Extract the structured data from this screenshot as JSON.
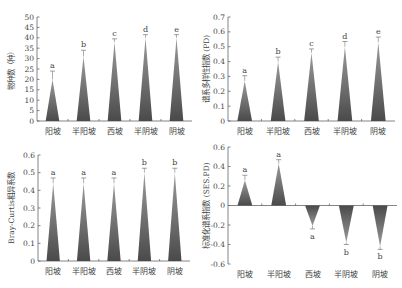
{
  "colors": {
    "bar_top": "#9a9a9a",
    "bar_bottom": "#4a4a4a",
    "axis": "#666666",
    "text": "#444444"
  },
  "chart_data": [
    {
      "id": "species",
      "type": "bar",
      "bar_shape": "triangle",
      "title": "",
      "xlabel": "",
      "ylabel": "物种数（种）",
      "categories": [
        "阳坡",
        "半阳坡",
        "西坡",
        "半阴坡",
        "阴坡"
      ],
      "values": [
        20,
        31,
        38,
        40,
        40
      ],
      "error_upper": [
        24,
        34,
        39.5,
        41.5,
        41.5
      ],
      "significance": [
        "a",
        "b",
        "c",
        "d",
        "e"
      ],
      "ylim": [
        0,
        50
      ],
      "yticks": [
        0,
        5,
        10,
        15,
        20,
        25,
        30,
        35,
        40,
        45,
        50
      ],
      "ytick_labels": [
        "0",
        "5",
        "10",
        "15",
        "20",
        "25",
        "30",
        "35",
        "40",
        "45",
        "50"
      ],
      "grid": false,
      "legend": "none"
    },
    {
      "id": "pd",
      "type": "bar",
      "bar_shape": "triangle",
      "title": "",
      "xlabel": "",
      "ylabel": "谱系多样性指数 (PD)",
      "categories": [
        "阳坡",
        "半阳坡",
        "西坡",
        "半阴坡",
        "阴坡"
      ],
      "values": [
        0.27,
        0.4,
        0.46,
        0.5,
        0.53
      ],
      "error_upper": [
        0.305,
        0.43,
        0.485,
        0.535,
        0.565
      ],
      "significance": [
        "a",
        "b",
        "c",
        "d",
        "e"
      ],
      "ylim": [
        0,
        0.7
      ],
      "yticks": [
        0,
        0.1,
        0.2,
        0.3,
        0.4,
        0.5,
        0.6,
        0.7
      ],
      "ytick_labels": [
        "0",
        "0.1",
        "0.2",
        "0.3",
        "0.4",
        "0.5",
        "0.6",
        "0.7"
      ],
      "grid": false,
      "legend": "none"
    },
    {
      "id": "bray",
      "type": "bar",
      "bar_shape": "triangle",
      "title": "",
      "xlabel": "",
      "ylabel": "Bray-Curtis相异系数",
      "categories": [
        "阳坡",
        "半阳坡",
        "西坡",
        "半阴坡",
        "阴坡"
      ],
      "values": [
        0.44,
        0.44,
        0.44,
        0.5,
        0.5
      ],
      "error_upper": [
        0.47,
        0.47,
        0.47,
        0.525,
        0.525
      ],
      "significance": [
        "a",
        "a",
        "a",
        "b",
        "b"
      ],
      "ylim": [
        0,
        0.6
      ],
      "yticks": [
        0,
        0.1,
        0.2,
        0.3,
        0.4,
        0.5,
        0.6
      ],
      "ytick_labels": [
        "0",
        "0.1",
        "0.2",
        "0.3",
        "0.4",
        "0.5",
        "0.6"
      ],
      "grid": false,
      "legend": "none"
    },
    {
      "id": "ses_pd",
      "type": "bar",
      "bar_shape": "triangle",
      "title": "",
      "xlabel": "",
      "ylabel": "标准化谱系指数 (SES.PD)",
      "categories": [
        "阳坡",
        "半阳坡",
        "西坡",
        "半阴坡",
        "阴坡"
      ],
      "values": [
        0.26,
        0.43,
        -0.21,
        -0.38,
        -0.42
      ],
      "error_extreme": [
        0.31,
        0.47,
        -0.24,
        -0.4,
        -0.45
      ],
      "significance": [
        "a",
        "a",
        "a",
        "b",
        "b"
      ],
      "ylim": [
        -0.6,
        0.6
      ],
      "yticks": [
        -0.6,
        -0.4,
        -0.2,
        0,
        0.2,
        0.4,
        0.6
      ],
      "ytick_labels": [
        "-0.6",
        "-0.4",
        "-0.2",
        "0",
        "0.2",
        "0.4",
        "0.6"
      ],
      "grid": false,
      "legend": "none"
    }
  ]
}
